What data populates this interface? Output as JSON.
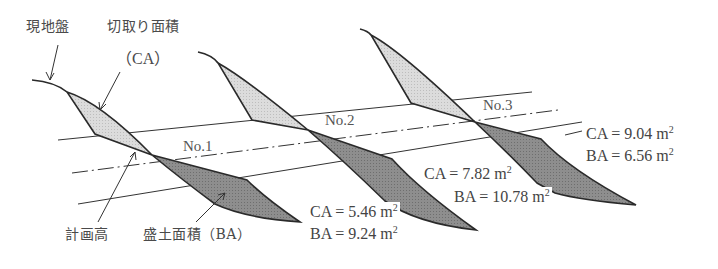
{
  "labels": {
    "ground": "現地盤",
    "cut_area": "切取り面積",
    "cut_abbr": "（CA）",
    "plan_height": "計画高",
    "fill_area": "盛土面積（BA）"
  },
  "stations": [
    {
      "name": "No.1",
      "ca_label": "CA = 5.46 m",
      "ba_label": "BA = 9.24 m",
      "ca": 5.46,
      "ba": 9.24
    },
    {
      "name": "No.2",
      "ca_label": "CA = 7.82 m",
      "ba_label": "BA = 10.78 m",
      "ca": 7.82,
      "ba": 10.78
    },
    {
      "name": "No.3",
      "ca_label": "CA = 9.04 m",
      "ba_label": "BA = 6.56 m",
      "ca": 9.04,
      "ba": 6.56
    }
  ],
  "unit_exponent": "2",
  "colors": {
    "cut_fill": "#d9d9d9",
    "bank_fill": "#8c8c8c",
    "outline": "#2a2a2a",
    "guide_line": "#333333"
  }
}
